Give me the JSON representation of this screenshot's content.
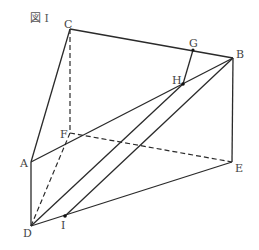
{
  "figure": {
    "title": "図 I"
  },
  "points": {
    "A": "A",
    "B": "B",
    "C": "C",
    "D": "D",
    "E": "E",
    "F": "F",
    "G": "G",
    "H": "H",
    "I": "I"
  }
}
